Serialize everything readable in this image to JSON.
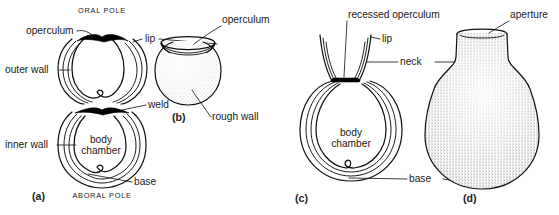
{
  "figure": {
    "background_color": "#ffffff",
    "ink_color": "#111111",
    "label_color": "#1a1a1a"
  },
  "panels": [
    {
      "key": "a",
      "caption": "(a)",
      "type": "sectional-view",
      "description": "Longitudinal section of a conjoined spherical vesicle showing double wall, operculum and weld",
      "orientation_labels": {
        "top": "ORAL POLE",
        "bottom": "ABORAL POLE"
      },
      "labels": [
        {
          "id": "operculum",
          "text": "operculum",
          "side": "left"
        },
        {
          "id": "outer-wall",
          "text": "outer wall",
          "side": "left"
        },
        {
          "id": "inner-wall",
          "text": "inner wall",
          "side": "left"
        },
        {
          "id": "body-chamber",
          "text": "body\nchamber",
          "side": "center",
          "line1": "body",
          "line2": "chamber"
        },
        {
          "id": "lip",
          "text": "lip",
          "side": "right"
        },
        {
          "id": "weld",
          "text": "weld",
          "side": "right"
        },
        {
          "id": "base",
          "text": "base",
          "side": "right"
        }
      ]
    },
    {
      "key": "b",
      "caption": "(b)",
      "type": "external-view",
      "description": "External view of a stippled spherical vesicle with an operculum disc on top",
      "labels": [
        {
          "id": "operculum",
          "text": "operculum",
          "side": "top-right"
        },
        {
          "id": "rough-wall",
          "text": "rough wall",
          "side": "bottom-right"
        }
      ]
    },
    {
      "key": "c",
      "caption": "(c)",
      "type": "sectional-view",
      "description": "Longitudinal section of a flask-shaped vesicle with recessed operculum, flaring neck and lip",
      "labels": [
        {
          "id": "recessed-operculum",
          "text": "recessed operculum",
          "side": "top"
        },
        {
          "id": "lip",
          "text": "lip",
          "side": "top-right"
        },
        {
          "id": "neck",
          "text": "neck",
          "side": "right"
        },
        {
          "id": "body-chamber",
          "text": "body\nchamber",
          "side": "center",
          "line1": "body",
          "line2": "chamber"
        },
        {
          "id": "base",
          "text": "base",
          "side": "bottom-right"
        }
      ]
    },
    {
      "key": "d",
      "caption": "(d)",
      "type": "external-view",
      "description": "External view of a stippled flask-shaped vesicle with open aperture at the top of the neck",
      "labels": [
        {
          "id": "aperture",
          "text": "aperture",
          "side": "top-right"
        }
      ]
    }
  ],
  "all_label_texts": [
    "ORAL POLE",
    "ABORAL POLE",
    "operculum",
    "outer wall",
    "inner wall",
    "body",
    "chamber",
    "lip",
    "weld",
    "base",
    "rough wall",
    "recessed operculum",
    "neck",
    "aperture",
    "(a)",
    "(b)",
    "(c)",
    "(d)"
  ]
}
